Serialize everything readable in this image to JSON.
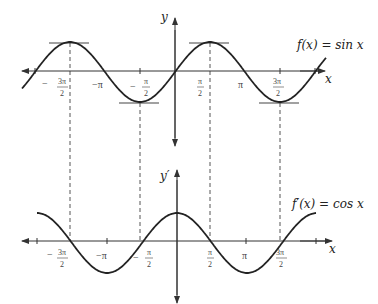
{
  "top_graph": {
    "function_label": "f(x) = sin x",
    "y_axis_label": "y",
    "x_axis_label": "x",
    "ticks": [
      "-3π/2",
      "-π",
      "-π/2",
      "π/2",
      "π",
      "3π/2"
    ]
  },
  "bottom_graph": {
    "function_label": "f′(x) = cos x",
    "y_axis_label": "y′",
    "x_axis_label": "x",
    "ticks": [
      "-3π/2",
      "-π",
      "-π/2",
      "π/2",
      "π",
      "3π/2"
    ]
  },
  "colors": {
    "curve": "#222222",
    "axis": "#333333",
    "dashed": "#555555"
  }
}
